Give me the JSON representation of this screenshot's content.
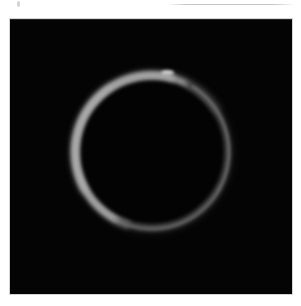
{
  "page": {
    "width": 301,
    "height": 306,
    "background_color": "#ffffff"
  },
  "artifacts": {
    "top_rule": {
      "name": "faint-horizontal-rule",
      "color": "#96969b"
    },
    "top_left_speck": {
      "name": "scan-speck",
      "color": "#a0a0a5"
    }
  },
  "photo_panel": {
    "name": "black-image-panel",
    "background_color": "#040404",
    "border_color": "#cdcdd0",
    "left": 10,
    "top": 19,
    "width": 282,
    "height": 275
  },
  "ring": {
    "name": "annulus-ring",
    "label": "annular ring of light",
    "center_x": 152,
    "center_y": 152,
    "outer_radius": 82,
    "inner_radius": 72,
    "core_color": "#8d8d8e",
    "bright_limb_color": "#a8a8a8",
    "bead_color": "#cdcdce",
    "interior_color": "#030303",
    "brightest_sector": "upper-left",
    "faintest_sector": "lower-right"
  },
  "chart_data": {
    "type": "scatter",
    "title": "",
    "xlabel": "",
    "ylabel": "",
    "categories": [
      "top",
      "upper-right",
      "right",
      "lower-right",
      "bottom",
      "lower-left",
      "left",
      "upper-left"
    ],
    "series": [
      {
        "name": "brightness (0-255 grey level)",
        "values": [
          150,
          120,
          105,
          92,
          118,
          140,
          158,
          168
        ]
      },
      {
        "name": "arc thickness (px)",
        "values": [
          6,
          4.5,
          3.5,
          2.5,
          4,
          5.5,
          7,
          8.5
        ]
      }
    ],
    "ylim": [
      0,
      255
    ],
    "grid": false,
    "legend": "none"
  }
}
